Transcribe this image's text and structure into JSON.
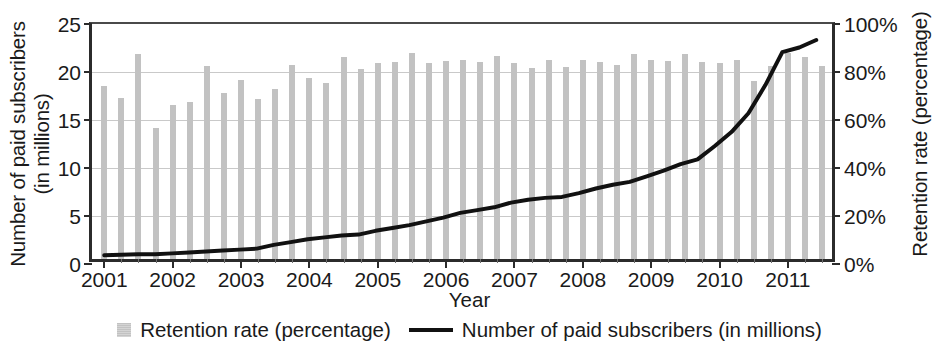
{
  "chart_data": {
    "type": "bar",
    "title": "",
    "xlabel": "Year",
    "ylabel": "Number of paid subscribers (in millions)",
    "ylabel_right": "Retention rate (percentage)",
    "grid": true,
    "legend_position": "bottom",
    "xlim": [
      2001,
      2011.75
    ],
    "ylim": [
      0,
      25
    ],
    "ylim_right": [
      0,
      100
    ],
    "y_ticks": [
      "0",
      "5",
      "10",
      "15",
      "20",
      "25"
    ],
    "y_tick_values": [
      0,
      5,
      10,
      15,
      20,
      25
    ],
    "y_ticks_right": [
      "0%",
      "20%",
      "40%",
      "60%",
      "80%",
      "100%"
    ],
    "y_tick_values_right": [
      0,
      20,
      40,
      60,
      80,
      100
    ],
    "x_ticks": [
      "2001",
      "2002",
      "2003",
      "2004",
      "2005",
      "2006",
      "2007",
      "2008",
      "2009",
      "2010",
      "2011"
    ],
    "x_tick_values": [
      2001,
      2002,
      2003,
      2004,
      2005,
      2006,
      2007,
      2008,
      2009,
      2010,
      2011
    ],
    "quarters": [
      "2001 Q1",
      "2001 Q2",
      "2001 Q3",
      "2001 Q4",
      "2002 Q1",
      "2002 Q2",
      "2002 Q3",
      "2002 Q4",
      "2003 Q1",
      "2003 Q2",
      "2003 Q3",
      "2003 Q4",
      "2004 Q1",
      "2004 Q2",
      "2004 Q3",
      "2004 Q4",
      "2005 Q1",
      "2005 Q2",
      "2005 Q3",
      "2005 Q4",
      "2006 Q1",
      "2006 Q2",
      "2006 Q3",
      "2006 Q4",
      "2007 Q1",
      "2007 Q2",
      "2007 Q3",
      "2007 Q4",
      "2008 Q1",
      "2008 Q2",
      "2008 Q3",
      "2008 Q4",
      "2009 Q1",
      "2009 Q2",
      "2009 Q3",
      "2009 Q4",
      "2010 Q1",
      "2010 Q2",
      "2010 Q3",
      "2010 Q4",
      "2011 Q1",
      "2011 Q2",
      "2011 Q3"
    ],
    "series": [
      {
        "name": "Retention rate (percentage)",
        "type": "bar",
        "axis": "right",
        "unit": "%",
        "color": "#c2c2c2",
        "values": [
          72,
          67,
          85.5,
          54.5,
          64,
          65.5,
          80.5,
          69,
          74.5,
          66.5,
          71,
          81,
          75.5,
          73.5,
          84,
          79,
          81.5,
          82,
          86,
          81.5,
          82.5,
          83,
          82,
          84.5,
          81.5,
          79.5,
          83,
          80,
          83,
          82,
          81,
          85.5,
          83,
          82.5,
          85.5,
          82,
          81.5,
          83,
          74,
          80.5,
          86,
          84,
          80.5
        ]
      },
      {
        "name": "Number of paid subscribers (in millions)",
        "type": "line",
        "axis": "left",
        "unit": "millions",
        "color": "#111111",
        "values": [
          0.4,
          0.45,
          0.5,
          0.5,
          0.6,
          0.7,
          0.8,
          0.9,
          1.0,
          1.1,
          1.5,
          1.8,
          2.1,
          2.3,
          2.5,
          2.6,
          3.0,
          3.3,
          3.6,
          4.0,
          4.4,
          4.9,
          5.2,
          5.5,
          6.0,
          6.3,
          6.5,
          6.6,
          7.0,
          7.5,
          7.9,
          8.2,
          8.8,
          9.4,
          10.1,
          10.6,
          12.0,
          13.5,
          15.5,
          18.5,
          22.0,
          22.5,
          23.3
        ]
      }
    ],
    "legend": [
      {
        "label": "Retention rate (percentage)",
        "marker": "square",
        "color": "#c2c2c2"
      },
      {
        "label": "Number of paid subscribers (in millions)",
        "marker": "line",
        "color": "#111111"
      }
    ]
  }
}
